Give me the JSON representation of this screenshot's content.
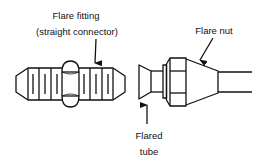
{
  "diagram": {
    "labels": {
      "flare_fitting_line1": "Flare fitting",
      "flare_fitting_line2": "(straight connector)",
      "flare_nut": "Flare nut",
      "flared_tube_line1": "Flared",
      "flared_tube_line2": "tube"
    },
    "colors": {
      "stroke": "#111111",
      "background": "#ffffff"
    }
  }
}
